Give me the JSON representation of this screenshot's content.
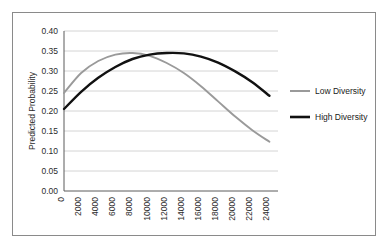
{
  "chart_data": {
    "type": "line",
    "title": "",
    "xlabel": "",
    "ylabel": "Predicted Probability",
    "xlim": [
      0,
      25000
    ],
    "ylim": [
      0.0,
      0.4
    ],
    "grid": true,
    "legend_position": "right",
    "x_tick_labels": [
      "0",
      "2000",
      "4000",
      "6000",
      "8000",
      "10000",
      "12000",
      "14000",
      "16000",
      "18000",
      "20000",
      "22000",
      "24000"
    ],
    "x_tick_values": [
      0,
      2000,
      4000,
      6000,
      8000,
      10000,
      12000,
      14000,
      16000,
      18000,
      20000,
      22000,
      24000
    ],
    "y_tick_labels": [
      "0.00",
      "0.05",
      "0.10",
      "0.15",
      "0.20",
      "0.25",
      "0.30",
      "0.35",
      "0.40"
    ],
    "y_tick_values": [
      0.0,
      0.05,
      0.1,
      0.15,
      0.2,
      0.25,
      0.3,
      0.35,
      0.4
    ],
    "x": [
      0,
      2000,
      4000,
      6000,
      8000,
      10000,
      12000,
      14000,
      16000,
      18000,
      20000,
      22000,
      24000
    ],
    "series": [
      {
        "name": "Low Diversity",
        "color": "#9a9a9a",
        "values": [
          0.245,
          0.295,
          0.325,
          0.341,
          0.345,
          0.338,
          0.32,
          0.295,
          0.262,
          0.224,
          0.186,
          0.152,
          0.123
        ]
      },
      {
        "name": "High Diversity",
        "color": "#111111",
        "values": [
          0.205,
          0.248,
          0.283,
          0.31,
          0.33,
          0.341,
          0.345,
          0.344,
          0.336,
          0.321,
          0.299,
          0.272,
          0.238
        ]
      }
    ]
  },
  "legend": {
    "items": [
      {
        "label": "Low Diversity"
      },
      {
        "label": "High Diversity"
      }
    ]
  },
  "colors": {
    "low_diversity": "#9a9a9a",
    "high_diversity": "#111111",
    "gridline": "#d4d4d4",
    "axis": "#5a5a5a",
    "frame_border": "#8a8a8a",
    "background": "#ffffff"
  }
}
